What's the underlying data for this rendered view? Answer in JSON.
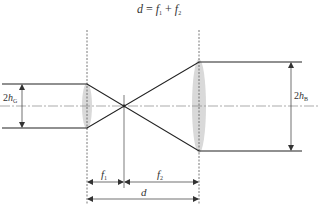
{
  "diagram": {
    "title": {
      "lhs": "d",
      "eq": " = ",
      "f1": "f",
      "f1_sub": "1",
      "plus": " + ",
      "f2": "f",
      "f2_sub": "2"
    },
    "labels": {
      "input_beam": {
        "prefix": "2",
        "var": "h",
        "sub": "G"
      },
      "output_beam": {
        "prefix": "2",
        "var": "h",
        "sub": "B"
      },
      "focal_1": {
        "var": "f",
        "sub": "1"
      },
      "focal_2": {
        "var": "f",
        "sub": "2"
      },
      "separation": {
        "var": "d"
      }
    },
    "colors": {
      "beam": "#222222",
      "axis": "#888888",
      "lens": "#d9d9d9",
      "guide": "#555555"
    }
  }
}
